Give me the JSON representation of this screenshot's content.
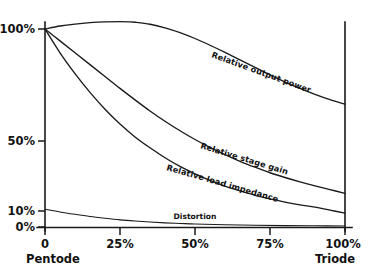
{
  "chart_data": {
    "type": "line",
    "title": "",
    "subtitle": "",
    "xlabel": "",
    "ylabel": "",
    "xlim": [
      0,
      100
    ],
    "ylim": [
      0,
      100
    ],
    "grid": false,
    "legend_position": "inline-along-curves",
    "x_tick_labels": [
      "0",
      "25%",
      "50%",
      "75%",
      "100%"
    ],
    "x_tick_values": [
      0,
      25,
      50,
      75,
      100
    ],
    "y_tick_labels": [
      "100%",
      "50%",
      "10%",
      "0%"
    ],
    "y_tick_values": [
      100,
      50,
      10,
      0
    ],
    "axis_end_labels": {
      "left": "Pentode",
      "right": "Triode"
    },
    "annotations": [
      "Relative output power",
      "Relative stage gain",
      "Relative load impedance",
      "Distortion"
    ],
    "series": [
      {
        "name": "Relative output power",
        "label_rotation_deg": 20,
        "x": [
          0,
          5,
          10,
          15,
          20,
          25,
          28,
          30,
          35,
          40,
          45,
          50,
          55,
          60,
          65,
          70,
          75,
          80,
          85,
          90,
          95,
          100
        ],
        "values": [
          100,
          101.5,
          102.5,
          103.2,
          103.6,
          103.7,
          103.6,
          103.4,
          102.4,
          100.6,
          98.2,
          95.2,
          91.8,
          88.2,
          84.4,
          80.6,
          76.8,
          73.2,
          70.0,
          67.0,
          64.3,
          62.0
        ]
      },
      {
        "name": "Relative stage gain",
        "label_rotation_deg": 17,
        "x": [
          0,
          5,
          10,
          15,
          20,
          25,
          30,
          35,
          40,
          45,
          50,
          55,
          60,
          65,
          70,
          75,
          80,
          85,
          90,
          95,
          100
        ],
        "values": [
          100,
          94.0,
          88.0,
          82.0,
          76.0,
          70.0,
          64.2,
          58.6,
          53.4,
          48.6,
          44.2,
          40.2,
          36.6,
          33.2,
          30.2,
          27.4,
          25.0,
          22.8,
          20.8,
          18.9,
          17.0
        ]
      },
      {
        "name": "Relative load impedance",
        "label_rotation_deg": 16,
        "x": [
          0,
          5,
          10,
          15,
          20,
          25,
          30,
          35,
          40,
          45,
          50,
          55,
          60,
          65,
          70,
          75,
          80,
          85,
          90,
          95,
          100
        ],
        "values": [
          100,
          88.0,
          77.5,
          68.0,
          59.5,
          52.0,
          45.5,
          40.0,
          35.0,
          30.6,
          26.8,
          23.5,
          20.6,
          18.2,
          16.0,
          14.2,
          12.6,
          11.2,
          10.0,
          8.5,
          7.0
        ]
      },
      {
        "name": "Distortion",
        "label_rotation_deg": 0,
        "x": [
          0,
          5,
          10,
          15,
          20,
          25,
          30,
          35,
          40,
          45,
          50,
          60,
          70,
          80,
          90,
          100
        ],
        "values": [
          9.0,
          7.6,
          6.4,
          5.3,
          4.4,
          3.6,
          3.0,
          2.5,
          2.1,
          1.8,
          1.5,
          1.1,
          0.85,
          0.7,
          0.6,
          0.5
        ]
      }
    ]
  },
  "axes": {
    "y_ticks": [
      {
        "label": "100%"
      },
      {
        "label": "50%"
      },
      {
        "label": "10%"
      },
      {
        "label": "0%"
      }
    ],
    "x_ticks": [
      {
        "label": "0"
      },
      {
        "label": "25%"
      },
      {
        "label": "50%"
      },
      {
        "label": "75%"
      },
      {
        "label": "100%"
      }
    ],
    "left_end_label": "Pentode",
    "right_end_label": "Triode"
  },
  "series_labels": {
    "output_power": "Relative output power",
    "stage_gain": "Relative stage gain",
    "load_impedance": "Relative load impedance",
    "distortion": "Distortion"
  },
  "colors": {
    "ink": "#1a1a1a",
    "background": "#ffffff"
  }
}
